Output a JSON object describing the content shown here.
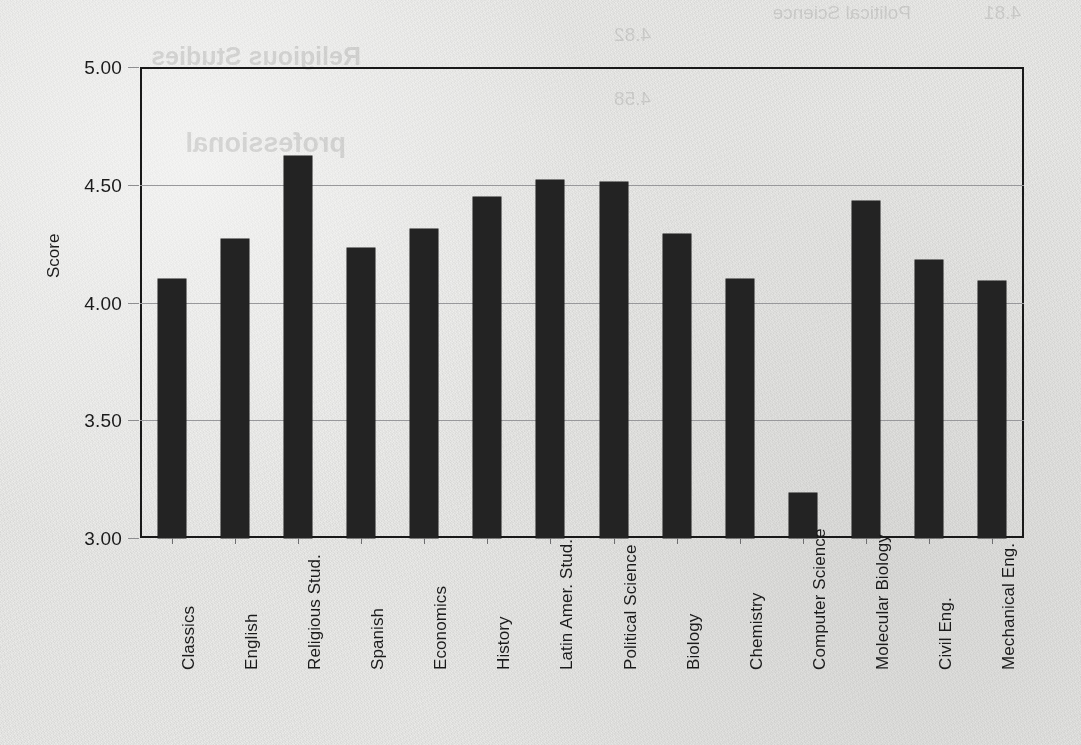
{
  "chart_data": {
    "type": "bar",
    "title": "",
    "xlabel": "",
    "ylabel": "Score",
    "ylim": [
      3.0,
      5.0
    ],
    "grid": true,
    "legend": false,
    "legend_position": "none",
    "bar_color": "#252525",
    "frame_color": "#1b1b1b",
    "gridline_color": "#98989a",
    "ytick_labels": [
      "5.00",
      "4.50",
      "4.00",
      "3.50",
      "3.00"
    ],
    "ytick_values": [
      5.0,
      4.5,
      4.0,
      3.5,
      3.0
    ],
    "categories": [
      "Classics",
      "English",
      "Religious Stud.",
      "Spanish",
      "Economics",
      "History",
      "Latin Amer. Stud.",
      "Political  Science",
      "Biology",
      "Chemistry",
      "Computer Science",
      "Molecular Biology",
      "Civil Eng.",
      "Mechanical Eng."
    ],
    "values": [
      4.1,
      4.27,
      4.62,
      4.23,
      4.31,
      4.45,
      4.52,
      4.51,
      4.29,
      4.1,
      3.19,
      4.43,
      4.18,
      4.09
    ]
  },
  "bleed_through": {
    "lines": [
      "4.81",
      "4.82",
      "4.58",
      "Political Science",
      "Religious Studies",
      "professional"
    ]
  }
}
